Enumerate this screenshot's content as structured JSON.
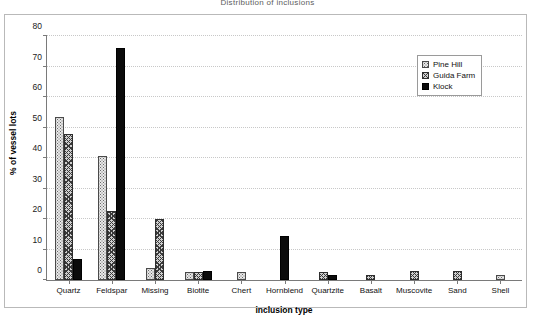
{
  "chart_data": {
    "type": "bar",
    "title": "Distribution of inclusions",
    "xlabel": "inclusion type",
    "ylabel": "% of vessel lots",
    "ylim": [
      0,
      80
    ],
    "ytick_step": 10,
    "yticks": [
      "0",
      "10",
      "20",
      "30",
      "40",
      "50",
      "60",
      "70",
      "80"
    ],
    "grid": true,
    "legend_position": "top-right",
    "categories": [
      "Quartz",
      "Feldspar",
      "Missing",
      "Biotite",
      "Chert",
      "Hornblend",
      "Quartzite",
      "Basalt",
      "Muscovite",
      "Sand",
      "Shell"
    ],
    "series": [
      {
        "name": "Pine Hill",
        "color": "#e8e8e8",
        "pattern": "dotted",
        "values": [
          53.5,
          40.5,
          4,
          2.5,
          2.5,
          0,
          0,
          0,
          0,
          0,
          1.5
        ]
      },
      {
        "name": "Guida Farm",
        "color": "#cfcfcf",
        "pattern": "cross-hatch",
        "values": [
          48,
          22.5,
          20,
          2.5,
          0,
          0,
          2.5,
          1.5,
          3,
          3,
          0
        ]
      },
      {
        "name": "Klock",
        "color": "#0b0b0b",
        "pattern": "solid",
        "values": [
          7,
          76,
          0,
          3,
          0,
          14.5,
          1.5,
          0,
          0,
          0,
          0
        ]
      }
    ]
  }
}
